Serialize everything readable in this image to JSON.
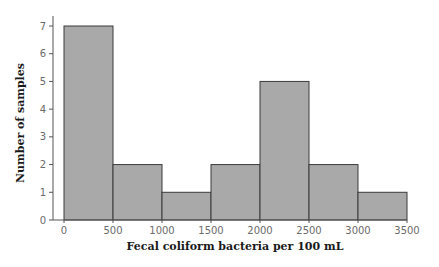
{
  "chart_data": {
    "type": "bar",
    "subtype": "histogram",
    "title": "",
    "xlabel": "Fecal coliform bacteria per 100 mL",
    "ylabel": "Number of samples",
    "bins": [
      {
        "start": 0,
        "end": 500,
        "count": 7
      },
      {
        "start": 500,
        "end": 1000,
        "count": 2
      },
      {
        "start": 1000,
        "end": 1500,
        "count": 1
      },
      {
        "start": 1500,
        "end": 2000,
        "count": 2
      },
      {
        "start": 2000,
        "end": 2500,
        "count": 5
      },
      {
        "start": 2500,
        "end": 3000,
        "count": 2
      },
      {
        "start": 3000,
        "end": 3500,
        "count": 1
      }
    ],
    "categories": [
      "0-500",
      "500-1000",
      "1000-1500",
      "1500-2000",
      "2000-2500",
      "2500-3000",
      "3000-3500"
    ],
    "values": [
      7,
      2,
      1,
      2,
      5,
      2,
      1
    ],
    "xticks": [
      "0",
      "500",
      "1000",
      "1500",
      "2000",
      "2500",
      "3000",
      "3500"
    ],
    "yticks": [
      "0",
      "1",
      "2",
      "3",
      "4",
      "5",
      "6",
      "7"
    ],
    "xlim": [
      0,
      3500
    ],
    "ylim": [
      0,
      7
    ],
    "grid": false,
    "legend": null,
    "colors": {
      "bar_fill": "#a9a9a9",
      "bar_edge": "#3a3a3a"
    }
  }
}
